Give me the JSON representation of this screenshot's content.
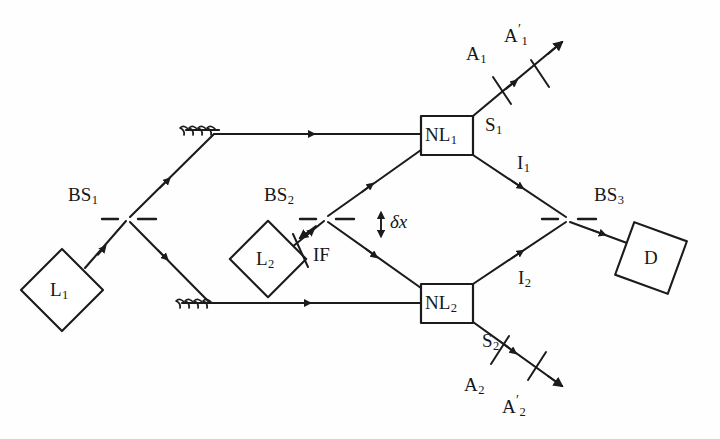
{
  "figure": {
    "type": "optical-setup-diagram",
    "width": 720,
    "height": 439,
    "background_color": "#ffffff",
    "line_color": "#1b1b1b"
  },
  "labels": {
    "bs1": {
      "text": "BS",
      "sub": "1"
    },
    "bs2": {
      "text": "BS",
      "sub": "2"
    },
    "bs3": {
      "text": "BS",
      "sub": "3"
    },
    "l1": {
      "text": "L",
      "sub": "1"
    },
    "l2": {
      "text": "L",
      "sub": "2"
    },
    "nl1": {
      "text": "NL",
      "sub": "1"
    },
    "nl2": {
      "text": "NL",
      "sub": "2"
    },
    "if": {
      "text": "IF",
      "sub": ""
    },
    "d": {
      "text": "D",
      "sub": ""
    },
    "s1": {
      "text": "S",
      "sub": "1"
    },
    "s2": {
      "text": "S",
      "sub": "2"
    },
    "i1": {
      "text": "I",
      "sub": "1"
    },
    "i2": {
      "text": "I",
      "sub": "2"
    },
    "a1": {
      "text": "A",
      "sub": "1"
    },
    "a1prime": {
      "text": "A",
      "sub": "1",
      "prime": "′"
    },
    "a2": {
      "text": "A",
      "sub": "2"
    },
    "a2prime": {
      "text": "A",
      "sub": "2",
      "prime": "′"
    },
    "deltax": {
      "text": "δx"
    }
  },
  "components": [
    {
      "name": "laser-1",
      "label": "L₁",
      "kind": "diamond",
      "cx": 62,
      "cy": 290,
      "size": 41,
      "rotation": 45
    },
    {
      "name": "laser-2",
      "label": "L₂",
      "kind": "diamond",
      "cx": 268,
      "cy": 259,
      "size": 38,
      "rotation": 45
    },
    {
      "name": "detector",
      "label": "D",
      "kind": "diamond",
      "cx": 651,
      "cy": 258,
      "size": 40,
      "rotation": 20
    },
    {
      "name": "crystal-nl1",
      "label": "NL₁",
      "kind": "rect",
      "x": 421,
      "y": 116,
      "w": 52,
      "h": 39
    },
    {
      "name": "crystal-nl2",
      "label": "NL₂",
      "kind": "rect",
      "x": 421,
      "y": 284,
      "w": 52,
      "h": 39
    },
    {
      "name": "beamsplitter-1",
      "label": "BS₁",
      "kind": "dashed-bs",
      "cx": 128,
      "cy": 219
    },
    {
      "name": "beamsplitter-2",
      "label": "BS₂",
      "kind": "dashed-bs",
      "cx": 326,
      "cy": 219
    },
    {
      "name": "beamsplitter-3",
      "label": "BS₃",
      "kind": "dashed-bs",
      "cx": 568,
      "cy": 219
    },
    {
      "name": "mirror-top",
      "label": "",
      "kind": "mirror",
      "x": 215,
      "y": 133
    },
    {
      "name": "mirror-bottom",
      "label": "",
      "kind": "mirror",
      "x": 210,
      "y": 303
    },
    {
      "name": "interference-filter",
      "label": "IF",
      "kind": "slab",
      "cx": 300,
      "cy": 250
    },
    {
      "name": "analyzer-a1",
      "label": "A₁",
      "kind": "slab",
      "cx": 502,
      "cy": 90
    },
    {
      "name": "analyzer-a1p",
      "label": "A₁′",
      "kind": "slab",
      "cx": 540,
      "cy": 73
    },
    {
      "name": "analyzer-a2",
      "label": "A₂",
      "kind": "slab",
      "cx": 500,
      "cy": 350
    },
    {
      "name": "analyzer-a2p",
      "label": "A₂′",
      "kind": "slab",
      "cx": 537,
      "cy": 366
    },
    {
      "name": "displacement-marker",
      "label": "δx",
      "kind": "double-arrow",
      "x": 378,
      "y": 210
    }
  ],
  "beams": [
    {
      "name": "beam-l1-to-bs1",
      "from": "laser-1",
      "to": "beamsplitter-1"
    },
    {
      "name": "beam-bs1-to-mirror-top",
      "from": "beamsplitter-1",
      "to": "mirror-top"
    },
    {
      "name": "beam-mirror-top-to-nl1",
      "from": "mirror-top",
      "to": "crystal-nl1"
    },
    {
      "name": "beam-bs1-to-mirror-bottom",
      "from": "beamsplitter-1",
      "to": "mirror-bottom"
    },
    {
      "name": "beam-mirror-bottom-to-nl2",
      "from": "mirror-bottom",
      "to": "crystal-nl2"
    },
    {
      "name": "beam-l2-to-bs2",
      "from": "laser-2",
      "to": "beamsplitter-2"
    },
    {
      "name": "beam-bs2-to-nl1",
      "from": "beamsplitter-2",
      "to": "crystal-nl1"
    },
    {
      "name": "beam-bs2-to-nl2",
      "from": "beamsplitter-2",
      "to": "crystal-nl2"
    },
    {
      "name": "beam-signal-1",
      "from": "crystal-nl1",
      "to": "analyzer-a1p",
      "label": "S₁"
    },
    {
      "name": "beam-signal-2",
      "from": "crystal-nl2",
      "to": "analyzer-a2p",
      "label": "S₂"
    },
    {
      "name": "beam-idler-1",
      "from": "crystal-nl1",
      "to": "beamsplitter-3",
      "label": "I₁"
    },
    {
      "name": "beam-idler-2",
      "from": "crystal-nl2",
      "to": "beamsplitter-3",
      "label": "I₂"
    },
    {
      "name": "beam-bs3-to-detector",
      "from": "beamsplitter-3",
      "to": "detector"
    }
  ]
}
